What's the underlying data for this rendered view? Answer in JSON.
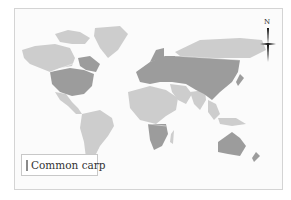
{
  "map": {
    "title": "Common carp distribution",
    "legend": {
      "items": [
        {
          "label": "Common carp",
          "color": "#9c9c9c"
        }
      ]
    },
    "north_arrow": {
      "label": "N"
    },
    "colors": {
      "present": "#9c9c9c",
      "absent": "#cdcdcd",
      "background": "#fbfbfb",
      "border": "#d4d4d4"
    },
    "regions_present": [
      "United States",
      "Eastern Canada",
      "Europe",
      "Central Asia",
      "China",
      "Southern Africa",
      "Australia",
      "New Zealand"
    ],
    "regions_absent": [
      "Alaska",
      "Western Canada",
      "Greenland",
      "Siberia",
      "Central America",
      "South America",
      "Northern Africa",
      "Middle East",
      "India",
      "Southeast Asia"
    ]
  }
}
